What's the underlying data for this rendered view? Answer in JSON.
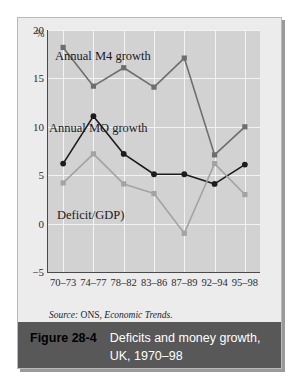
{
  "figure": {
    "number": "Figure 28-4",
    "caption_line1": "Deficits and money growth,",
    "caption_line2": "UK, 1970–98",
    "source": {
      "prefix": "Source:",
      "body": "ONS,",
      "italic": "Economic Trends."
    }
  },
  "chart_data": {
    "type": "line",
    "title": "Deficits and money growth, UK, 1970–98",
    "xlabel": "",
    "ylabel": "%",
    "unit_label": "%",
    "categories": [
      "70–73",
      "74–77",
      "78–82",
      "83–86",
      "87–89",
      "92–94",
      "95–98"
    ],
    "ylim": [
      -5,
      20
    ],
    "yticks": [
      20,
      15,
      10,
      5,
      0,
      -5
    ],
    "ytick_labels": [
      "20",
      "15",
      "10",
      "5",
      "0",
      "−5"
    ],
    "grid": true,
    "legend": "inline-annotations",
    "series": [
      {
        "name": "Annual M4 growth",
        "color": "#6e6e6e",
        "marker": "square",
        "values": [
          18.2,
          14.2,
          16.1,
          14.1,
          17.1,
          7.1,
          10.0
        ]
      },
      {
        "name": "Annual MO growth",
        "color": "#1c1c1c",
        "marker": "circle",
        "values": [
          6.2,
          11.1,
          7.2,
          5.1,
          5.1,
          4.1,
          6.1
        ]
      },
      {
        "name": "Deficit/GDP)",
        "color": "#a3a3a3",
        "marker": "square",
        "values": [
          4.2,
          7.2,
          4.1,
          3.1,
          -1.0,
          6.2,
          3.0
        ]
      }
    ],
    "annotations": [
      {
        "text": "Annual M4 growth"
      },
      {
        "text": "Annual MO growth"
      },
      {
        "text": "Deficit/GDP)"
      }
    ]
  }
}
